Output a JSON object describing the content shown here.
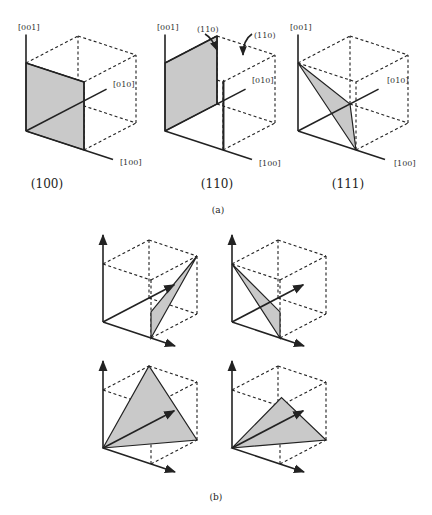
{
  "part_a": {
    "label": "(a)",
    "panels": [
      {
        "caption": "(100)",
        "axes": {
          "z": "[001]",
          "y": "[010]",
          "x": "[100]"
        },
        "plane": "100"
      },
      {
        "caption": "(110)",
        "axes": {
          "z": "[001]",
          "y": "[010]",
          "x": "[100]"
        },
        "plane": "110",
        "annotations": [
          "(110)",
          "(110)"
        ]
      },
      {
        "caption": "(111)",
        "axes": {
          "z": "[001]",
          "y": "[010]",
          "x": "[100]"
        },
        "plane": "111"
      }
    ]
  },
  "part_b": {
    "label": "(b)",
    "panels": [
      {
        "plane": "b1"
      },
      {
        "plane": "b2"
      },
      {
        "plane": "b3"
      },
      {
        "plane": "b4"
      }
    ]
  }
}
